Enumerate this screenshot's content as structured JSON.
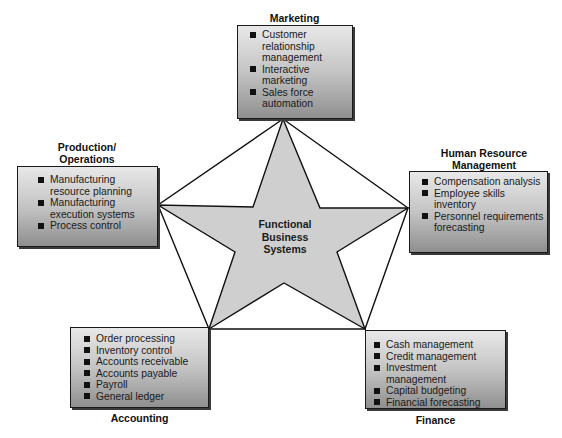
{
  "center": {
    "line1": "Functional",
    "line2": "Business",
    "line3": "Systems"
  },
  "colors": {
    "star_fill": "#cfcfcf",
    "lines": "#111111",
    "box_top": "#e8e8e8",
    "box_bottom": "#8f8f8f"
  },
  "marketing": {
    "title": "Marketing",
    "items": [
      "Customer relationship management",
      "Interactive marketing",
      "Sales force automation"
    ]
  },
  "production": {
    "title_line1": "Production/",
    "title_line2": "Operations",
    "items": [
      "Manufacturing resource planning",
      "Manufacturing execution systems",
      "Process control"
    ]
  },
  "hr": {
    "title_line1": "Human Resource",
    "title_line2": "Management",
    "items": [
      "Compensation analysis",
      "Employee skills inventory",
      "Personnel requirements forecasting"
    ]
  },
  "accounting": {
    "title": "Accounting",
    "items": [
      "Order processing",
      "Inventory control",
      "Accounts receivable",
      "Accounts payable",
      "Payroll",
      "General ledger"
    ]
  },
  "finance": {
    "title": "Finance",
    "items": [
      "Cash management",
      "Credit management",
      "Investment management",
      "Capital budgeting",
      "Financial forecasting"
    ]
  }
}
